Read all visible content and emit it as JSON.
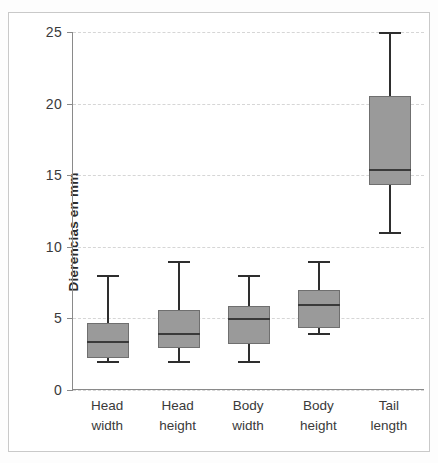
{
  "chart_data": {
    "type": "box",
    "title": "",
    "xlabel": "",
    "ylabel": "Dierencias en mm",
    "ylim": [
      0,
      25
    ],
    "yticks": [
      0,
      5,
      10,
      15,
      20,
      25
    ],
    "ytick_labels": [
      "0",
      "5",
      "10",
      "15",
      "20",
      "25"
    ],
    "grid": true,
    "legend": "none",
    "categories": [
      "Head width",
      "Head height",
      "Body width",
      "Body height",
      "Tail length"
    ],
    "category_lines": [
      {
        "l1": "Head",
        "l2": "width"
      },
      {
        "l1": "Head",
        "l2": "height"
      },
      {
        "l1": "Body",
        "l2": "width"
      },
      {
        "l1": "Body",
        "l2": "height"
      },
      {
        "l1": "Tail",
        "l2": "length"
      }
    ],
    "boxes": [
      {
        "name": "Head width",
        "whisker_low": 2.0,
        "q1": 2.2,
        "median": 3.4,
        "q3": 4.7,
        "whisker_high": 8.0
      },
      {
        "name": "Head height",
        "whisker_low": 2.0,
        "q1": 2.9,
        "median": 4.0,
        "q3": 5.6,
        "whisker_high": 9.0
      },
      {
        "name": "Body width",
        "whisker_low": 2.0,
        "q1": 3.2,
        "median": 5.0,
        "q3": 5.9,
        "whisker_high": 8.0
      },
      {
        "name": "Body height",
        "whisker_low": 4.0,
        "q1": 4.3,
        "median": 6.0,
        "q3": 7.0,
        "whisker_high": 9.0
      },
      {
        "name": "Tail length",
        "whisker_low": 11.0,
        "q1": 14.3,
        "median": 15.4,
        "q3": 20.5,
        "whisker_high": 25.0
      }
    ],
    "colors": {
      "box_fill": "#9a9a9a",
      "box_border": "#6f6f6f",
      "whisker": "#2e2e2e",
      "median": "#3a3a3a",
      "gridline": "#d6d6d6",
      "axis": "#8a8a8a",
      "text": "#3a3a3a",
      "background": "#ffffff"
    }
  }
}
